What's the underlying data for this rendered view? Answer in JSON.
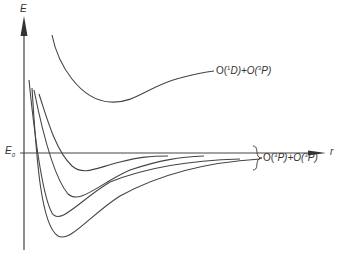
{
  "diagram": {
    "type": "potential-energy-curves",
    "axes": {
      "y_label": "E",
      "x_label": "r",
      "reference_level_label": "E",
      "reference_level_subscript": "0"
    },
    "curves": [
      {
        "name": "upper-state",
        "asymptote": "O(1D)+O(3P)"
      },
      {
        "name": "lower-state-1",
        "asymptote": "O(3P)+O(3P)"
      },
      {
        "name": "lower-state-2",
        "asymptote": "O(3P)+O(3P)"
      },
      {
        "name": "lower-state-3",
        "asymptote": "O(3P)+O(3P)"
      },
      {
        "name": "lower-state-4",
        "asymptote": "O(3P)+O(3P)"
      }
    ],
    "labels": {
      "upper": {
        "pre": "O(",
        "sup1": "1",
        "mid1": "D)+O(",
        "sup2": "3",
        "post": "P)"
      },
      "lower": {
        "pre": "O(",
        "sup1": "3",
        "mid1": "P)+O(",
        "sup2": "3",
        "post": "P)"
      }
    }
  }
}
